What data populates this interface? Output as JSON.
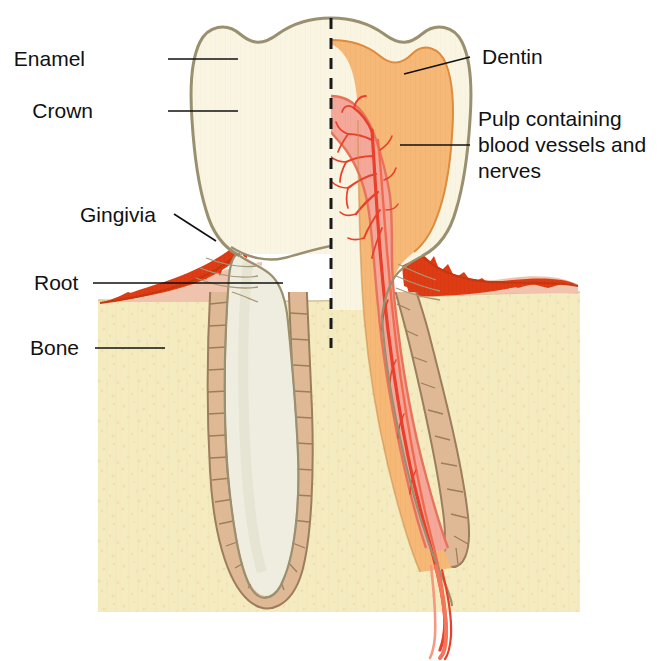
{
  "figure": {
    "width": 662,
    "height": 661,
    "background": "#FFFFFF"
  },
  "labels": [
    {
      "id": "enamel",
      "text": "Enamel",
      "side": "left",
      "x": 85,
      "y": 66,
      "leader": {
        "x1": 168,
        "y1": 59,
        "x2": 238,
        "y2": 59
      }
    },
    {
      "id": "crown",
      "text": "Crown",
      "side": "left",
      "x": 93,
      "y": 118,
      "leader": {
        "x1": 168,
        "y1": 111,
        "x2": 238,
        "y2": 111
      }
    },
    {
      "id": "gingivia",
      "text": "Gingivia",
      "side": "left",
      "x": 80,
      "y": 218,
      "leader": {
        "x1": 175,
        "y1": 215,
        "x2": 215,
        "y2": 240
      }
    },
    {
      "id": "root",
      "text": "Root",
      "side": "left",
      "x": 34,
      "y": 289,
      "leader": {
        "x1": 93,
        "y1": 283,
        "x2": 283,
        "y2": 283
      }
    },
    {
      "id": "bone",
      "text": "Bone",
      "side": "left",
      "x": 30,
      "y": 352,
      "leader": {
        "x1": 95,
        "y1": 348,
        "x2": 165,
        "y2": 348
      }
    },
    {
      "id": "dentin",
      "text": "Dentin",
      "side": "right",
      "x": 482,
      "y": 64,
      "leader": {
        "x1": 405,
        "y1": 75,
        "x2": 470,
        "y2": 57
      }
    },
    {
      "id": "pulp",
      "text": "Pulp containing",
      "side": "right",
      "x": 478,
      "y": 125,
      "leader": null
    },
    {
      "id": "pulp2",
      "text": "blood vessels and",
      "side": "right",
      "x": 478,
      "y": 150,
      "leader": {
        "x1": 400,
        "y1": 145,
        "x2": 470,
        "y2": 145
      }
    },
    {
      "id": "pulp3",
      "text": "nerves",
      "side": "right",
      "x": 478,
      "y": 175,
      "leader": null
    }
  ],
  "structures": {
    "enamel": {
      "name": "Enamel",
      "color": "#FAF5E2"
    },
    "dentin": {
      "name": "Dentin",
      "color": "#F5B877"
    },
    "pulp": {
      "name": "Pulp",
      "color": "#F4A89A"
    },
    "vessels": {
      "name": "Blood vessels",
      "color": "#E8402A"
    },
    "gingiva": {
      "name": "Gingivia",
      "color": "#E03C14"
    },
    "gingiva_pale": {
      "name": "Gingiva submucosa",
      "color": "#EFC3AE"
    },
    "bone": {
      "name": "Bone",
      "color": "#F5EBC0"
    },
    "pdl": {
      "name": "Periodontal ligament",
      "color": "#DFB995"
    },
    "root_left": {
      "name": "Root (uncut half)",
      "color": "#EFEDE0"
    },
    "outline": {
      "name": "Outline stroke",
      "color": "#9A9070"
    },
    "midline": {
      "name": "Section midline",
      "color": "#1A1A1A"
    }
  },
  "midline": {
    "x": 331,
    "y_top": 18,
    "y_bottom": 348
  }
}
